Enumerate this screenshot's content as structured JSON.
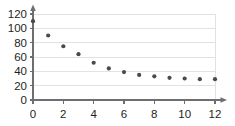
{
  "chart_data": {
    "type": "scatter",
    "title": "",
    "subtitle": "",
    "xlabel": "",
    "ylabel": "",
    "x": [
      0,
      1,
      2,
      3,
      4,
      5,
      6,
      7,
      8,
      9,
      10,
      11,
      12
    ],
    "values": [
      110,
      90,
      75,
      64,
      52,
      44,
      39,
      35,
      33,
      31,
      30,
      29,
      29
    ],
    "series": [
      {
        "name": "",
        "values": [
          110,
          90,
          75,
          64,
          52,
          44,
          39,
          35,
          33,
          31,
          30,
          29,
          29
        ]
      }
    ],
    "xlim": [
      0,
      12
    ],
    "ylim": [
      0,
      120
    ],
    "xticks": [
      0,
      2,
      4,
      6,
      8,
      10,
      12
    ],
    "yticks": [
      0,
      20,
      40,
      60,
      80,
      100,
      120
    ],
    "xtick_labels": [
      "0",
      "2",
      "4",
      "6",
      "8",
      "10",
      "12"
    ],
    "ytick_labels": [
      "0",
      "20",
      "40",
      "60",
      "80",
      "100",
      "120"
    ],
    "grid": "horizontal",
    "legend": "none",
    "annotations": [],
    "colors": {
      "point": "#494a4c",
      "gridline": "#e2e2e4",
      "axis": "#6d6e71",
      "tick_text": "#231f20",
      "background": "#ffffff"
    }
  }
}
